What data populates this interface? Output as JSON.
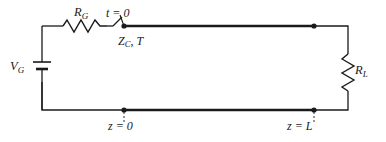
{
  "figure": {
    "name": "transmission-line-circuit",
    "background_color": "#ffffff",
    "line_color": "#1a1a1a"
  },
  "labels": {
    "source": {
      "symbol": "V",
      "subscript": "G",
      "text": "V_G"
    },
    "series_resistor": {
      "symbol": "R",
      "subscript": "G",
      "text": "R_G"
    },
    "switch": {
      "text": "t = 0",
      "variable": "t",
      "relation": "=",
      "value": "0"
    },
    "line_params": {
      "text": "Z_C, T",
      "impedance": "Z",
      "impedance_subscript": "C",
      "delay": "T"
    },
    "load_resistor": {
      "symbol": "R",
      "subscript": "L",
      "text": "R_L"
    },
    "position_near": {
      "text": "z = 0",
      "variable": "z",
      "relation": "=",
      "value": "0"
    },
    "position_far": {
      "text": "z = L",
      "variable": "z",
      "relation": "=",
      "value": "L"
    }
  },
  "components": {
    "battery": {
      "name": "voltage-source",
      "type": "battery-symbol"
    },
    "resistor_g": {
      "name": "resistor-rg",
      "type": "zigzag-horizontal"
    },
    "switch": {
      "name": "switch-t0",
      "type": "open-switch"
    },
    "transmission_line": {
      "name": "transmission-line",
      "type": "thick-parallel-lines"
    },
    "resistor_l": {
      "name": "resistor-rl",
      "type": "zigzag-vertical"
    },
    "nodes": [
      {
        "name": "node-top-left",
        "x": 124,
        "y": 26
      },
      {
        "name": "node-top-right",
        "x": 314,
        "y": 26
      },
      {
        "name": "node-bottom-left",
        "x": 124,
        "y": 110
      },
      {
        "name": "node-bottom-right",
        "x": 314,
        "y": 110
      }
    ]
  }
}
